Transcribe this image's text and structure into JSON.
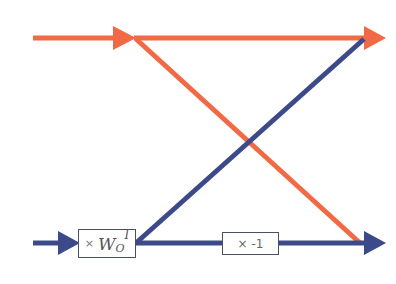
{
  "diagram": {
    "type": "butterfly",
    "colors": {
      "top_signal": "#f26a45",
      "bottom_signal": "#3d4a8a",
      "box_border": "#4a5060"
    },
    "twiddle_box": {
      "times": "×",
      "symbol": "W",
      "subscript": "O",
      "superscript": "I"
    },
    "negate_box": {
      "label": "× -1"
    },
    "edges": [
      {
        "from": "top-input",
        "to": "top-output",
        "color": "orange"
      },
      {
        "from": "top-input",
        "to": "bottom-output",
        "color": "orange"
      },
      {
        "from": "bottom-input",
        "to": "twiddle-box",
        "color": "blue"
      },
      {
        "from": "twiddle-box",
        "to": "top-output",
        "color": "blue"
      },
      {
        "from": "twiddle-box",
        "to": "negate-box",
        "color": "blue"
      },
      {
        "from": "negate-box",
        "to": "bottom-output",
        "color": "blue"
      }
    ]
  }
}
